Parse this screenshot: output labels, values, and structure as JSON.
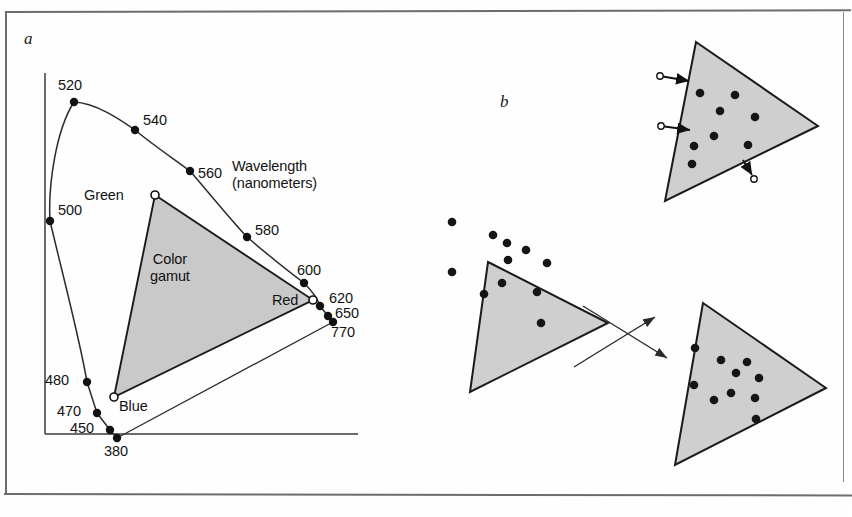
{
  "figure": {
    "panels": [
      {
        "id": "a",
        "label": "a",
        "name": "cie-chromaticity-diagram"
      },
      {
        "id": "b",
        "label": "b",
        "name": "gamut-mapping-diagram"
      }
    ],
    "colors": {
      "gamut_fill": "#c9c9c9",
      "triangle_fill": "#cfcfcf",
      "stroke": "#1a1a1a",
      "curve": "#2b2b2b",
      "frame": "#6d6d6d",
      "background": "#fefefe"
    }
  },
  "panel_a": {
    "label": "a",
    "axis_caption_line1": "Wavelength",
    "axis_caption_line2": "(nanometers)",
    "gamut_caption_line1": "Color",
    "gamut_caption_line2": "gamut",
    "primaries": [
      {
        "name": "Green",
        "label": "Green",
        "x": 155,
        "y": 195,
        "label_x": 84,
        "label_y": 187
      },
      {
        "name": "Red",
        "label": "Red",
        "x": 313,
        "y": 300,
        "label_x": 272,
        "label_y": 292
      },
      {
        "name": "Blue",
        "label": "Blue",
        "x": 114,
        "y": 397,
        "label_x": 119,
        "label_y": 398
      }
    ],
    "spectral_points": [
      {
        "wavelength": "380",
        "x": 117,
        "y": 438,
        "label_x": 104,
        "label_y": 443
      },
      {
        "wavelength": "450",
        "x": 110,
        "y": 430,
        "label_x": 70,
        "label_y": 420
      },
      {
        "wavelength": "470",
        "x": 97,
        "y": 413,
        "label_x": 57,
        "label_y": 403
      },
      {
        "wavelength": "480",
        "x": 87,
        "y": 382,
        "label_x": 45,
        "label_y": 372
      },
      {
        "wavelength": "500",
        "x": 50,
        "y": 221,
        "label_x": 58,
        "label_y": 202
      },
      {
        "wavelength": "520",
        "x": 74,
        "y": 102,
        "label_x": 58,
        "label_y": 77
      },
      {
        "wavelength": "540",
        "x": 135,
        "y": 130,
        "label_x": 143,
        "label_y": 112
      },
      {
        "wavelength": "560",
        "x": 190,
        "y": 171,
        "label_x": 198,
        "label_y": 165
      },
      {
        "wavelength": "580",
        "x": 247,
        "y": 237,
        "label_x": 255,
        "label_y": 222
      },
      {
        "wavelength": "600",
        "x": 304,
        "y": 283,
        "label_x": 297,
        "label_y": 262
      },
      {
        "wavelength": "620",
        "x": 320,
        "y": 306,
        "label_x": 329,
        "label_y": 290
      },
      {
        "wavelength": "650",
        "x": 328,
        "y": 316,
        "label_x": 335,
        "label_y": 305
      },
      {
        "wavelength": "770",
        "x": 333,
        "y": 322,
        "label_x": 331,
        "label_y": 324
      }
    ],
    "axes": {
      "y_axis": {
        "x": 45,
        "y_top": 73,
        "y_bottom": 434
      },
      "x_axis": {
        "y": 434,
        "x_left": 45,
        "x_right": 358
      }
    },
    "spectral_locus_path": "M 117 438 L 110 430 L 97 413 L 87 382 C 80 340 62 272 50 221 C 48 185 56 130 74 102 C 95 103 118 118 135 130 C 153 145 174 159 190 171 C 210 194 230 219 247 237 C 267 254 288 271 304 283 C 312 291 318 300 320 306 L 328 316 L 333 322",
    "purple_line_path": "M 117 438 L 333 322",
    "gamut_triangle_path": "M 155 195 L 313 300 L 114 397 Z"
  },
  "panel_b": {
    "label": "b",
    "triangles": [
      {
        "name": "source-gamut-triangle",
        "path": "M 488 262 L 608 323 L 470 392 Z",
        "inside_dots": [
          {
            "x": 493,
            "y": 235
          },
          {
            "x": 507,
            "y": 243
          },
          {
            "x": 526,
            "y": 250
          },
          {
            "x": 508,
            "y": 260
          },
          {
            "x": 547,
            "y": 263
          },
          {
            "x": 502,
            "y": 283
          },
          {
            "x": 484,
            "y": 294
          },
          {
            "x": 537,
            "y": 292
          }
        ],
        "outside_dots": [
          {
            "x": 452,
            "y": 222
          },
          {
            "x": 452,
            "y": 272
          },
          {
            "x": 541,
            "y": 323
          }
        ]
      },
      {
        "name": "clipped-gamut-triangle",
        "path": "M 696 42 L 818 126 L 665 201 Z",
        "inside_dots": [
          {
            "x": 700,
            "y": 93
          },
          {
            "x": 735,
            "y": 95
          },
          {
            "x": 720,
            "y": 111
          },
          {
            "x": 755,
            "y": 117
          },
          {
            "x": 714,
            "y": 136
          },
          {
            "x": 694,
            "y": 146
          },
          {
            "x": 748,
            "y": 145
          },
          {
            "x": 692,
            "y": 164
          }
        ],
        "clip_arrows": [
          {
            "from_x": 660,
            "from_y": 76,
            "to_x": 689,
            "to_y": 81,
            "circle_x": 660,
            "circle_y": 76
          },
          {
            "from_x": 661,
            "from_y": 126,
            "to_x": 690,
            "to_y": 130,
            "circle_x": 661,
            "circle_y": 126
          },
          {
            "from_x": 743,
            "from_y": 160,
            "to_x": 752,
            "to_y": 175,
            "circle_x": 754,
            "circle_y": 179
          }
        ]
      },
      {
        "name": "compressed-gamut-triangle",
        "path": "M 703 303 L 826 388 L 675 465 Z",
        "inside_dots": [
          {
            "x": 695,
            "y": 348
          },
          {
            "x": 721,
            "y": 360
          },
          {
            "x": 747,
            "y": 362
          },
          {
            "x": 736,
            "y": 373
          },
          {
            "x": 759,
            "y": 378
          },
          {
            "x": 694,
            "y": 385
          },
          {
            "x": 731,
            "y": 393
          },
          {
            "x": 714,
            "y": 400
          },
          {
            "x": 755,
            "y": 398
          },
          {
            "x": 756,
            "y": 419
          }
        ],
        "clip_arrows": []
      }
    ],
    "mapping_arrows": [
      {
        "name": "arrow-to-clipped",
        "from_x": 574,
        "from_y": 367,
        "to_x": 655,
        "to_y": 317
      },
      {
        "name": "arrow-to-compressed",
        "from_x": 583,
        "from_y": 306,
        "to_x": 667,
        "to_y": 358
      }
    ]
  }
}
